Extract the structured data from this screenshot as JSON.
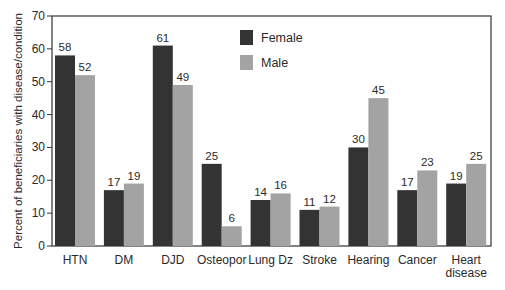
{
  "chart_data": {
    "type": "bar",
    "title": "",
    "xlabel": "",
    "ylabel": "Percent of beneficiaries with disease/condition",
    "ylim": [
      0,
      70
    ],
    "yticks": [
      0,
      10,
      20,
      30,
      40,
      50,
      60,
      70
    ],
    "grid": false,
    "legend_position": "upper center (inside plot)",
    "categories": [
      "HTN",
      "DM",
      "DJD",
      "Osteopor",
      "Lung Dz",
      "Stroke",
      "Hearing",
      "Cancer",
      "Heart disease"
    ],
    "category_label_lines": [
      [
        "HTN"
      ],
      [
        "DM"
      ],
      [
        "DJD"
      ],
      [
        "Osteopor"
      ],
      [
        "Lung Dz"
      ],
      [
        "Stroke"
      ],
      [
        "Hearing"
      ],
      [
        "Cancer"
      ],
      [
        "Heart",
        "disease"
      ]
    ],
    "series": [
      {
        "name": "Female",
        "color": "#333333",
        "values": [
          58,
          17,
          61,
          25,
          14,
          11,
          30,
          17,
          19
        ]
      },
      {
        "name": "Male",
        "color": "#a3a3a3",
        "values": [
          52,
          19,
          49,
          6,
          16,
          12,
          45,
          23,
          25
        ]
      }
    ],
    "data_labels": true
  }
}
